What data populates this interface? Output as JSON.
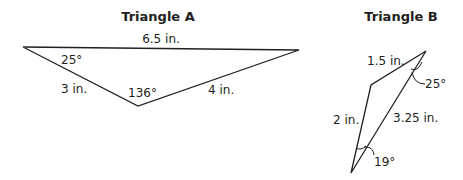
{
  "triangle_a": {
    "title": "Triangle A",
    "sides": {
      "top": "6.5 in.",
      "left": "3 in.",
      "right": "4 in."
    },
    "angles": {
      "left": "25°",
      "bottom": "136°"
    }
  },
  "triangle_b": {
    "title": "Triangle B",
    "sides": {
      "top": "1.5 in.",
      "left": "2 in.",
      "diagonal": "3.25 in."
    },
    "angles": {
      "top": "25°",
      "bottom": "19°"
    }
  }
}
